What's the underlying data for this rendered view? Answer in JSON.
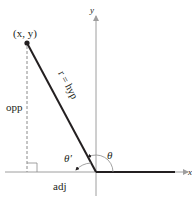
{
  "diagram": {
    "type": "reference-angle-triangle",
    "labels": {
      "point": "(x, y)",
      "hypotenuse": "r = hyp",
      "opposite": "opp",
      "adjacent": "adj",
      "angle": "θ",
      "reference_angle": "θ′",
      "x_axis": "x",
      "y_axis": "y"
    },
    "colors": {
      "line": "#231f20",
      "axis": "#9e9e9e",
      "dashed": "#8a8a8a"
    },
    "geometry": {
      "origin": [
        96,
        172
      ],
      "point": [
        27,
        43
      ]
    }
  }
}
